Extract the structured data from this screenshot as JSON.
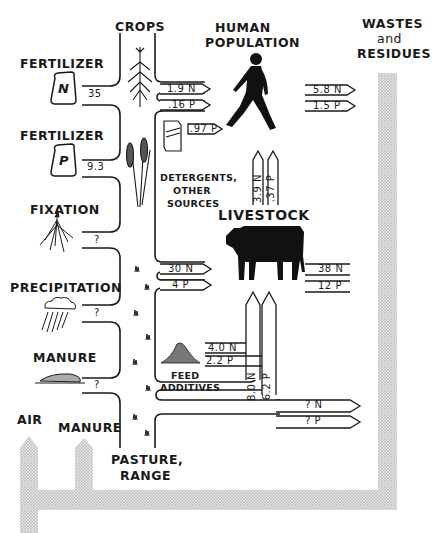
{
  "diagram": {
    "nodes": {
      "crops": "CROPS",
      "human_population": [
        "HUMAN",
        "POPULATION"
      ],
      "wastes_and_residues": [
        "WASTES",
        "and",
        "RESIDUES"
      ],
      "fertilizer_n": "FERTILIZER",
      "fertilizer_p": "FERTILIZER",
      "fixation": "FIXATION",
      "precipitation": "PRECIPITATION",
      "manure_input": "MANURE",
      "detergents": [
        "DETERGENTS,",
        "OTHER",
        "SOURCES"
      ],
      "livestock": "LIVESTOCK",
      "feed_additives": [
        "FEED",
        "ADDITIVES"
      ],
      "air": "AIR",
      "manure_output": "MANURE",
      "pasture_range": [
        "PASTURE,",
        "RANGE"
      ]
    },
    "icons": {
      "fertilizer_n_bag": "N",
      "fertilizer_p_bag": "P"
    },
    "flows": {
      "fertilizer_n_to_crops": "35",
      "fertilizer_p_to_crops": "9.3",
      "fixation_to_pasture": "?",
      "precipitation_to_pasture": "?",
      "manure_to_pasture": "?",
      "crops_to_human_n": "1.9 N",
      "crops_to_human_p": ".16 P",
      "detergents_to_human_p": ".97 P",
      "human_to_wastes_n": "5.8 N",
      "human_to_wastes_p": "1.5 P",
      "livestock_to_human_n": "3.9 N",
      "livestock_to_human_p": ".37 P",
      "crops_to_livestock_n": "30 N",
      "crops_to_livestock_p": "4 P",
      "livestock_to_wastes_n": "38 N",
      "livestock_to_wastes_p": "12 P",
      "feed_additives_n": "4.0 N",
      "feed_additives_p": "2.2 P",
      "pasture_to_livestock_n": "8.0 N",
      "pasture_to_livestock_p": "6.2 P",
      "pasture_to_wastes_n": "? N",
      "pasture_to_wastes_p": "? P"
    },
    "colors": {
      "ink": "#1a1a1a",
      "stipple": "#c8c8c8",
      "background": "#ffffff"
    }
  }
}
